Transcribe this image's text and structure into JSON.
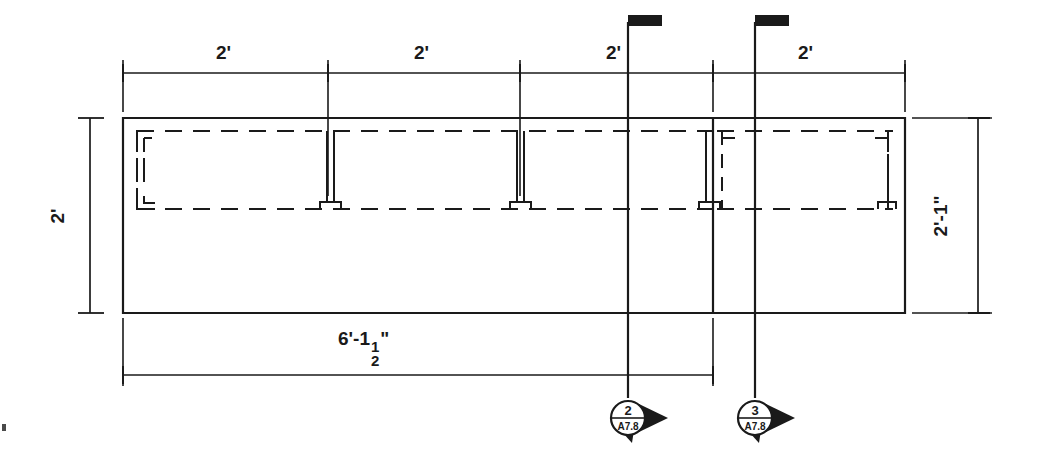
{
  "drawing": {
    "title": "Partial Framing Plan Detail",
    "type": "architectural-plan-detail",
    "line_color": "#1a1a1a",
    "background_color": "#ffffff"
  },
  "dimensions": {
    "top_chain": {
      "label_values": [
        "2'",
        "2'",
        "2'",
        "2'"
      ],
      "segments": [
        {
          "label": "2'",
          "x_start": 123,
          "x_end": 328
        },
        {
          "label": "2'",
          "x_start": 328,
          "x_end": 520
        },
        {
          "label": "2'",
          "x_start": 520,
          "x_end": 713
        },
        {
          "label": "2'",
          "x_start": 713,
          "x_end": 905
        }
      ],
      "line_y": 73
    },
    "left_vertical": {
      "label": "2'",
      "x": 90,
      "y_start": 118,
      "y_end": 313
    },
    "right_vertical": {
      "label": "2'-1\"",
      "x": 978,
      "y_start": 118,
      "y_end": 313
    },
    "bottom_overall": {
      "label_feet": "6'-1",
      "label_fraction_num": "1",
      "label_fraction_den": "2",
      "label_inch": "\"",
      "label_full": "6'-1 1/2\"",
      "x_start": 123,
      "x_end": 713,
      "line_y": 375
    }
  },
  "section_marks": [
    {
      "name": "section-2",
      "number": "2",
      "sheet": "A7.8",
      "cut_line_x": 628,
      "cut_line_top_y": 18,
      "cut_line_bottom_y": 398,
      "marker_cx": 628,
      "marker_cy": 418,
      "direction": "right"
    },
    {
      "name": "section-3",
      "number": "3",
      "sheet": "A7.8",
      "cut_line_x": 755,
      "cut_line_top_y": 18,
      "cut_line_bottom_y": 398,
      "marker_cx": 755,
      "marker_cy": 418,
      "direction": "right"
    }
  ],
  "geometry": {
    "left_slab": {
      "x": 123,
      "y": 118,
      "w": 590,
      "h": 195
    },
    "right_slab": {
      "x": 713,
      "y": 118,
      "w": 192,
      "h": 195
    },
    "inner_dashed_left": {
      "x": 137,
      "y": 131,
      "w": 576,
      "h": 78
    },
    "inner_dashed_right": {
      "x": 717,
      "y": 131,
      "w": 176,
      "h": 78
    },
    "studs_x": [
      137,
      330,
      520,
      713,
      893
    ],
    "stud_top_y": 131,
    "stud_bottom_y": 209
  }
}
